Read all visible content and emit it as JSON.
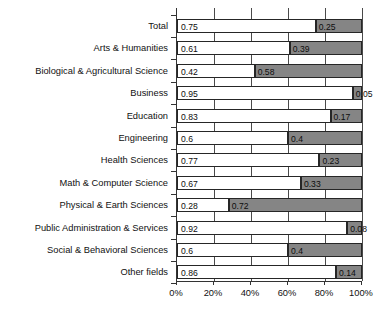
{
  "chart_data": {
    "type": "bar",
    "orientation": "horizontal",
    "stacked": true,
    "title": "",
    "subtitle": "",
    "xlabel": "",
    "ylabel": "",
    "xlim": [
      0,
      1
    ],
    "grid": true,
    "legend": "none",
    "xticks": [
      "0%",
      "20%",
      "40%",
      "60%",
      "80%",
      "100%"
    ],
    "xtick_values": [
      0,
      0.2,
      0.4,
      0.6,
      0.8,
      1.0
    ],
    "categories": [
      "Total",
      "Arts & Humanities",
      "Biological & Agricultural Science",
      "Business",
      "Education",
      "Engineering",
      "Health Sciences",
      "Math & Computer Science",
      "Physical & Earth Sciences",
      "Public Administration & Services",
      "Social & Behavioral Sciences",
      "Other fields"
    ],
    "series": [
      {
        "name": "segment-1",
        "color": "#ffffff",
        "values": [
          0.75,
          0.61,
          0.42,
          0.95,
          0.83,
          0.6,
          0.77,
          0.67,
          0.28,
          0.92,
          0.6,
          0.86
        ],
        "labels": [
          "0.75",
          "0.61",
          "0.42",
          "0.95",
          "0.83",
          "0.6",
          "0.77",
          "0.67",
          "0.28",
          "0.92",
          "0.6",
          "0.86"
        ]
      },
      {
        "name": "segment-2",
        "color": "#858585",
        "values": [
          0.25,
          0.39,
          0.58,
          0.05,
          0.17,
          0.4,
          0.23,
          0.33,
          0.72,
          0.08,
          0.4,
          0.14
        ],
        "labels": [
          "0.25",
          "0.39",
          "0.58",
          "0.05",
          "0.17",
          "0.4",
          "0.23",
          "0.33",
          "0.72",
          "0.08",
          "0.4",
          "0.14"
        ]
      }
    ]
  }
}
